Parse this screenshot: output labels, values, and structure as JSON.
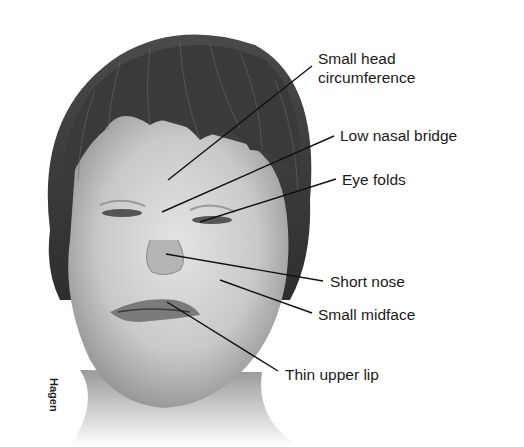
{
  "figure": {
    "artist_signature": "Hagen",
    "labels": [
      {
        "id": "small-head-circumference",
        "line1": "Small head",
        "line2": "circumference"
      },
      {
        "id": "low-nasal-bridge",
        "line1": "Low nasal bridge"
      },
      {
        "id": "eye-folds",
        "line1": "Eye folds"
      },
      {
        "id": "short-nose",
        "line1": "Short nose"
      },
      {
        "id": "small-midface",
        "line1": "Small midface"
      },
      {
        "id": "thin-upper-lip",
        "line1": "Thin upper lip"
      }
    ]
  }
}
